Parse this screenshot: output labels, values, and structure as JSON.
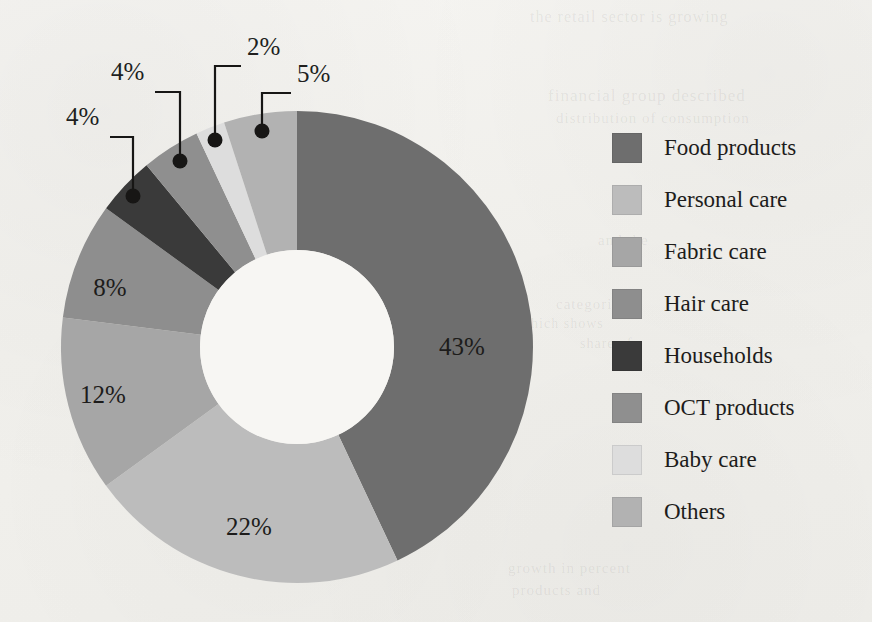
{
  "chart_data": {
    "type": "pie",
    "variant": "donut",
    "title": "",
    "subtitle": "",
    "xlabel": "",
    "ylabel": "",
    "legend_position": "right",
    "grid": false,
    "value_suffix": "%",
    "start_angle_deg": 0,
    "direction": "clockwise",
    "categories": [
      "Food products",
      "Personal care",
      "Fabric care",
      "Hair care",
      "Households",
      "OCT products",
      "Baby care",
      "Others"
    ],
    "values": [
      43,
      22,
      12,
      8,
      4,
      4,
      2,
      5
    ],
    "labels": [
      "43%",
      "22%",
      "12%",
      "8%",
      "4%",
      "4%",
      "2%",
      "5%"
    ],
    "colors": [
      "#6e6e6e",
      "#bcbcbc",
      "#a6a6a6",
      "#8e8e8e",
      "#3a3a3a",
      "#8f8f8f",
      "#dddddd",
      "#b2b2b2"
    ],
    "label_placement": [
      "inside",
      "inside",
      "inside",
      "inside",
      "callout",
      "callout",
      "callout",
      "callout"
    ]
  },
  "legend": {
    "items": [
      {
        "label": "Food products",
        "color": "#6e6e6e",
        "value": "43%"
      },
      {
        "label": "Personal care",
        "color": "#bcbcbc",
        "value": "22%"
      },
      {
        "label": "Fabric care",
        "color": "#a6a6a6",
        "value": "12%"
      },
      {
        "label": "Hair care",
        "color": "#8e8e8e",
        "value": "8%"
      },
      {
        "label": "Households",
        "color": "#3a3a3a",
        "value": "4%"
      },
      {
        "label": "OCT products",
        "color": "#8f8f8f",
        "value": "4%"
      },
      {
        "label": "Baby care",
        "color": "#dddddd",
        "value": "2%"
      },
      {
        "label": "Others",
        "color": "#b2b2b2",
        "value": "5%"
      }
    ]
  },
  "inside_labels": [
    {
      "text": "43%",
      "x": 462,
      "y": 355
    },
    {
      "text": "22%",
      "x": 249,
      "y": 535
    },
    {
      "text": "12%",
      "x": 103,
      "y": 403
    },
    {
      "text": "8%",
      "x": 110,
      "y": 296
    }
  ],
  "callouts": [
    {
      "text": "4%",
      "text_x": 66,
      "text_y": 119,
      "dot_x": 133,
      "dot_y": 196,
      "elbow_x": 133,
      "elbow_y": 137
    },
    {
      "text": "4%",
      "text_x": 111,
      "text_y": 74,
      "dot_x": 180,
      "dot_y": 161,
      "elbow_x": 180,
      "elbow_y": 92
    },
    {
      "text": "2%",
      "text_x": 247,
      "text_y": 49,
      "dot_x": 215,
      "dot_y": 140,
      "elbow_x": 215,
      "elbow_y": 66
    },
    {
      "text": "5%",
      "text_x": 297,
      "text_y": 76,
      "dot_x": 262,
      "dot_y": 131,
      "elbow_x": 262,
      "elbow_y": 93
    }
  ],
  "geometry": {
    "center_x": 297,
    "center_y": 347,
    "outer_radius": 236,
    "inner_radius": 97,
    "hole_color": "#f7f6f3"
  },
  "ghost_text": [
    {
      "text": "the retail sector is growing",
      "x": 530,
      "y": 8,
      "size": 16
    },
    {
      "text": "financial group described",
      "x": 548,
      "y": 86,
      "size": 17
    },
    {
      "text": "distribution of consumption",
      "x": 556,
      "y": 110,
      "size": 15
    },
    {
      "text": "and the",
      "x": 598,
      "y": 232,
      "size": 15
    },
    {
      "text": "categories",
      "x": 556,
      "y": 296,
      "size": 15
    },
    {
      "text": "which shows",
      "x": 520,
      "y": 316,
      "size": 14
    },
    {
      "text": "share of",
      "x": 580,
      "y": 336,
      "size": 14
    },
    {
      "text": "growth in percent",
      "x": 508,
      "y": 560,
      "size": 15
    },
    {
      "text": "products and",
      "x": 512,
      "y": 582,
      "size": 15
    },
    {
      "text": "consumer",
      "x": 196,
      "y": 272,
      "size": 15
    },
    {
      "text": "of the market",
      "x": 208,
      "y": 300,
      "size": 15
    },
    {
      "text": "is still",
      "x": 232,
      "y": 330,
      "size": 15
    }
  ]
}
